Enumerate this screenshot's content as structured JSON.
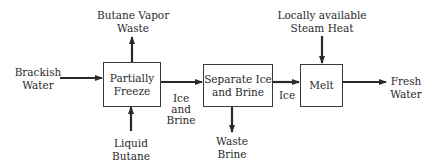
{
  "diagram": {
    "type": "process-flow",
    "nodes": [
      {
        "id": "freeze",
        "lines": [
          "Partially",
          "Freeze"
        ]
      },
      {
        "id": "separate",
        "lines": [
          "Separate Ice",
          "and Brine"
        ]
      },
      {
        "id": "melt",
        "lines": [
          "Melt"
        ]
      }
    ],
    "inputs": {
      "brackish_water": {
        "lines": [
          "Brackish",
          "Water"
        ]
      },
      "liquid_butane": {
        "lines": [
          "Liquid",
          "Butane"
        ]
      },
      "steam_heat": {
        "lines": [
          "Locally available",
          "Steam Heat"
        ]
      }
    },
    "outputs": {
      "butane_vapor_waste": {
        "lines": [
          "Butane Vapor",
          "Waste"
        ]
      },
      "waste_brine": {
        "lines": [
          "Waste",
          "Brine"
        ]
      },
      "fresh_water": {
        "lines": [
          "Fresh",
          "Water"
        ]
      }
    },
    "edges": {
      "ice_and_brine": {
        "lines": [
          "Ice",
          "and",
          "Brine"
        ]
      },
      "ice": {
        "lines": [
          "Ice"
        ]
      }
    },
    "colors": {
      "line": "#2a2a2a",
      "text": "#2a2a2a",
      "background": "#ffffff"
    }
  }
}
